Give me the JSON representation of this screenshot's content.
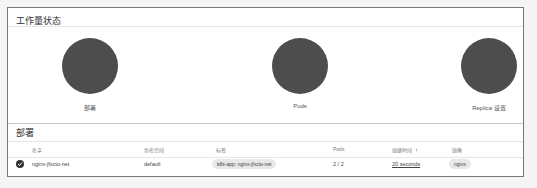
{
  "workload_status": {
    "title": "工作量状态",
    "charts": [
      {
        "label": "部署",
        "color": "#4d4d4d"
      },
      {
        "label": "Pods",
        "color": "#4d4d4d"
      },
      {
        "label": "Replica 设置",
        "color": "#4d4d4d"
      }
    ]
  },
  "deployments": {
    "title": "部署",
    "columns": [
      "名字",
      "命名空间",
      "标签",
      "Pods",
      "创建时间",
      "镜像"
    ],
    "sort_icon": "↑",
    "rows": [
      {
        "status_icon": "check-circle-icon",
        "name": "nginx-jfxcto-net",
        "namespace": "default",
        "labels": "k8s-app: nginx-jfxcto-net",
        "pods": "2 / 2",
        "created": "20 seconds",
        "images": "nginx"
      }
    ]
  }
}
